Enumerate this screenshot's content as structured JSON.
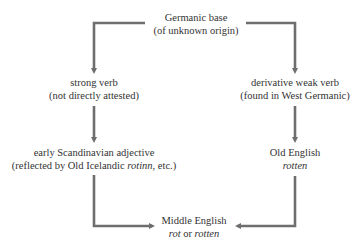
{
  "diagram": {
    "arrow_color": "#6e6e6e",
    "text_color": "#333333",
    "nodes": {
      "germanic_base": {
        "line1": "Germanic base",
        "line2": "(of unknown origin)"
      },
      "strong_verb": {
        "line1": "strong verb",
        "line2": "(not directly attested)"
      },
      "weak_verb": {
        "line1": "derivative weak verb",
        "line2": "(found in West Germanic)"
      },
      "scandinavian_adjective": {
        "line1": "early Scandinavian adjective",
        "line2_prefix": "(reflected by Old Icelandic ",
        "line2_italic": "rotinn",
        "line2_suffix": ", etc.)"
      },
      "old_english": {
        "line1": "Old English",
        "line2_italic": "rotten"
      },
      "middle_english": {
        "line1": "Middle English",
        "line2_italic_a": "rot",
        "line2_connector": " or ",
        "line2_italic_b": "rotten"
      }
    },
    "edges": [
      {
        "from": "germanic_base",
        "to": "strong_verb"
      },
      {
        "from": "germanic_base",
        "to": "weak_verb"
      },
      {
        "from": "strong_verb",
        "to": "scandinavian_adjective"
      },
      {
        "from": "weak_verb",
        "to": "old_english"
      },
      {
        "from": "scandinavian_adjective",
        "to": "middle_english"
      },
      {
        "from": "old_english",
        "to": "middle_english"
      }
    ]
  }
}
